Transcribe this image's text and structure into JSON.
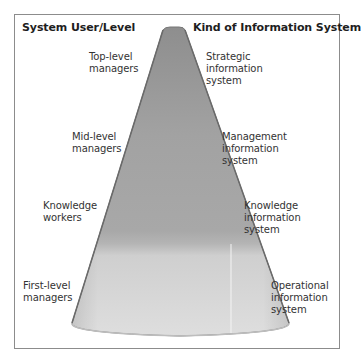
{
  "diagram": {
    "type": "cone-hierarchy",
    "headers": {
      "left": "System User/Level",
      "right": "Kind of Information System"
    },
    "levels": [
      {
        "user_line1": "Top-level",
        "user_line2": "managers",
        "system_line1": "Strategic",
        "system_line2": "information",
        "system_line3": "system"
      },
      {
        "user_line1": "Mid-level",
        "user_line2": "managers",
        "system_line1": "Management",
        "system_line2": "information",
        "system_line3": "system"
      },
      {
        "user_line1": "Knowledge",
        "user_line2": "workers",
        "system_line1": "Knowledge",
        "system_line2": "information",
        "system_line3": "system"
      },
      {
        "user_line1": "First-level",
        "user_line2": "managers",
        "system_line1": "Operational",
        "system_line2": "information",
        "system_line3": "system"
      }
    ],
    "colors": {
      "frame_border": "#8c8c8c",
      "cone_top": "#8a8a8a",
      "cone_mid": "#9e9e9e",
      "cone_lower": "#b0b0b0",
      "cone_base_band": "#dcdcdc",
      "cone_edge": "#6e6e6e"
    }
  }
}
